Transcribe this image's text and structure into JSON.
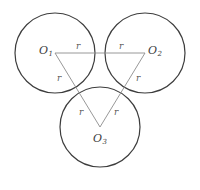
{
  "figure": {
    "stroke_color": "#3d3d3d",
    "triangle_color": "#8c8c8c",
    "background": "#ffffff",
    "circle_radius_px": 40,
    "circles": [
      {
        "id": "circle-1",
        "cx": 55,
        "cy": 53,
        "r": 40
      },
      {
        "id": "circle-2",
        "cx": 145,
        "cy": 53,
        "r": 40
      },
      {
        "id": "circle-3",
        "cx": 100,
        "cy": 127,
        "r": 40
      }
    ],
    "centers": [
      {
        "id": "O1",
        "label": "O",
        "subscript": "1",
        "x": 55,
        "y": 53
      },
      {
        "id": "O2",
        "label": "O",
        "subscript": "2",
        "x": 145,
        "y": 53
      },
      {
        "id": "O3",
        "label": "O",
        "subscript": "3",
        "x": 100,
        "y": 127
      }
    ],
    "radius_labels": [
      {
        "id": "r-top-left",
        "text": "r"
      },
      {
        "id": "r-top-right",
        "text": "r"
      },
      {
        "id": "r-left",
        "text": "r"
      },
      {
        "id": "r-right",
        "text": "r"
      },
      {
        "id": "r-bottom-left",
        "text": "r"
      },
      {
        "id": "r-bottom-right",
        "text": "r"
      }
    ],
    "triangle_sides": [
      {
        "id": "side-O1-O2",
        "from": "O1",
        "to": "O2"
      },
      {
        "id": "side-O1-O3",
        "from": "O1",
        "to": "O3"
      },
      {
        "id": "side-O2-O3",
        "from": "O2",
        "to": "O3"
      }
    ]
  }
}
